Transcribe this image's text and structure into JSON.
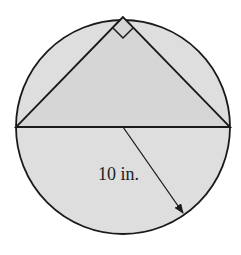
{
  "diagram": {
    "radius_label": "10 in.",
    "colors": {
      "fill": "#dedede",
      "stroke": "#1a1a1a",
      "background": "#ffffff"
    },
    "circle": {
      "cx": 123,
      "cy": 127,
      "r": 107
    },
    "triangle": {
      "apex": [
        123,
        17
      ],
      "left": [
        16,
        127
      ],
      "right": [
        230,
        127
      ]
    },
    "right_angle_marker": true,
    "arrow": {
      "from": [
        123,
        127
      ],
      "to": [
        183,
        213
      ]
    }
  }
}
